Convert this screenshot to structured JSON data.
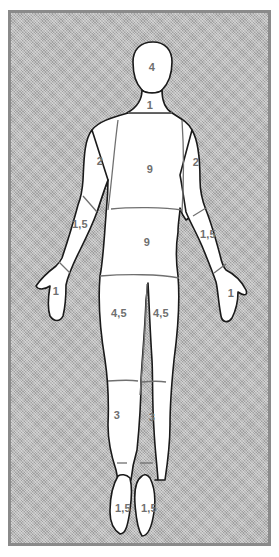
{
  "diagram": {
    "type": "body-surface-area-rule-of-nines",
    "view": "posterior",
    "colors": {
      "background_pattern": "#b9b9b9",
      "frame": "#8a8a8a",
      "body_fill": "#ffffff",
      "outline": "#1a1a1a",
      "label_text": "#6f6f6f"
    },
    "regions": [
      {
        "id": "head",
        "label": "4",
        "x": 152,
        "y": 67
      },
      {
        "id": "neck",
        "label": "1",
        "x": 150,
        "y": 105
      },
      {
        "id": "upper-back",
        "label": "9",
        "x": 150,
        "y": 169
      },
      {
        "id": "left-upper-arm",
        "label": "2",
        "x": 100,
        "y": 161
      },
      {
        "id": "right-upper-arm",
        "label": "2",
        "x": 196,
        "y": 162
      },
      {
        "id": "left-forearm",
        "label": "1,5",
        "x": 80,
        "y": 224
      },
      {
        "id": "right-forearm",
        "label": "1,5",
        "x": 208,
        "y": 234
      },
      {
        "id": "lower-back",
        "label": "9",
        "x": 147,
        "y": 242
      },
      {
        "id": "left-hand",
        "label": "1",
        "x": 56,
        "y": 291
      },
      {
        "id": "right-hand",
        "label": "1",
        "x": 231,
        "y": 293
      },
      {
        "id": "left-thigh",
        "label": "4,5",
        "x": 119,
        "y": 313
      },
      {
        "id": "right-thigh",
        "label": "4,5",
        "x": 161,
        "y": 313
      },
      {
        "id": "left-lower-leg",
        "label": "3",
        "x": 117,
        "y": 415
      },
      {
        "id": "right-lower-leg",
        "label": "3",
        "x": 152,
        "y": 417
      },
      {
        "id": "left-foot",
        "label": "1,5",
        "x": 123,
        "y": 508
      },
      {
        "id": "right-foot",
        "label": "1,5",
        "x": 149,
        "y": 508
      }
    ]
  }
}
